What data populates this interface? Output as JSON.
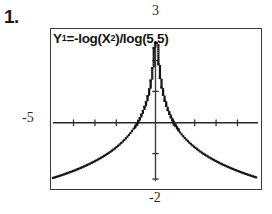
{
  "problem": {
    "number": "1."
  },
  "graph": {
    "equation_display": "Y1=-log(X²)/log(5.5)",
    "equation_parts": {
      "y_var": "Y",
      "y_index": "1",
      "equals": "=-log(X",
      "exponent": "2",
      "tail": ")/log(5.5)"
    },
    "window_labels": {
      "top": "3",
      "left": "-5",
      "bottom": "-2"
    }
  },
  "chart_data": {
    "type": "line",
    "xlabel": "",
    "ylabel": "",
    "xlim": [
      -5,
      5
    ],
    "ylim": [
      -2,
      3
    ],
    "grid": false,
    "legend": "none",
    "axis_tick_labels": {
      "xmax_top": "3",
      "xmin_left": "-5",
      "ymin_bottom": "-2"
    },
    "annotations": [
      "vertical asymptote at x = 0",
      "even function, symmetric about y-axis"
    ],
    "x": [
      -5.0,
      -4.6,
      -4.2,
      -3.8,
      -3.4,
      -3.0,
      -2.6,
      -2.2,
      -1.8,
      -1.4,
      -1.0,
      -0.8,
      -0.6,
      -0.45,
      -0.32,
      -0.22,
      -0.14,
      -0.08,
      -0.04,
      -0.02,
      0.02,
      0.04,
      0.08,
      0.14,
      0.22,
      0.32,
      0.45,
      0.6,
      0.8,
      1.0,
      1.4,
      1.8,
      2.2,
      2.6,
      3.0,
      3.4,
      3.8,
      4.2,
      4.6,
      5.0
    ],
    "y": [
      -1.888,
      -1.791,
      -1.691,
      -1.584,
      -1.469,
      -1.289,
      -1.122,
      -0.928,
      -0.689,
      -0.394,
      0.0,
      0.262,
      0.599,
      0.937,
      1.3,
      1.77,
      2.3,
      2.95,
      3.72,
      4.54,
      4.54,
      3.72,
      2.95,
      2.3,
      1.77,
      1.3,
      0.937,
      0.599,
      0.262,
      0.0,
      -0.394,
      -0.689,
      -0.928,
      -1.122,
      -1.289,
      -1.469,
      -1.584,
      -1.691,
      -1.791,
      -1.888
    ]
  }
}
